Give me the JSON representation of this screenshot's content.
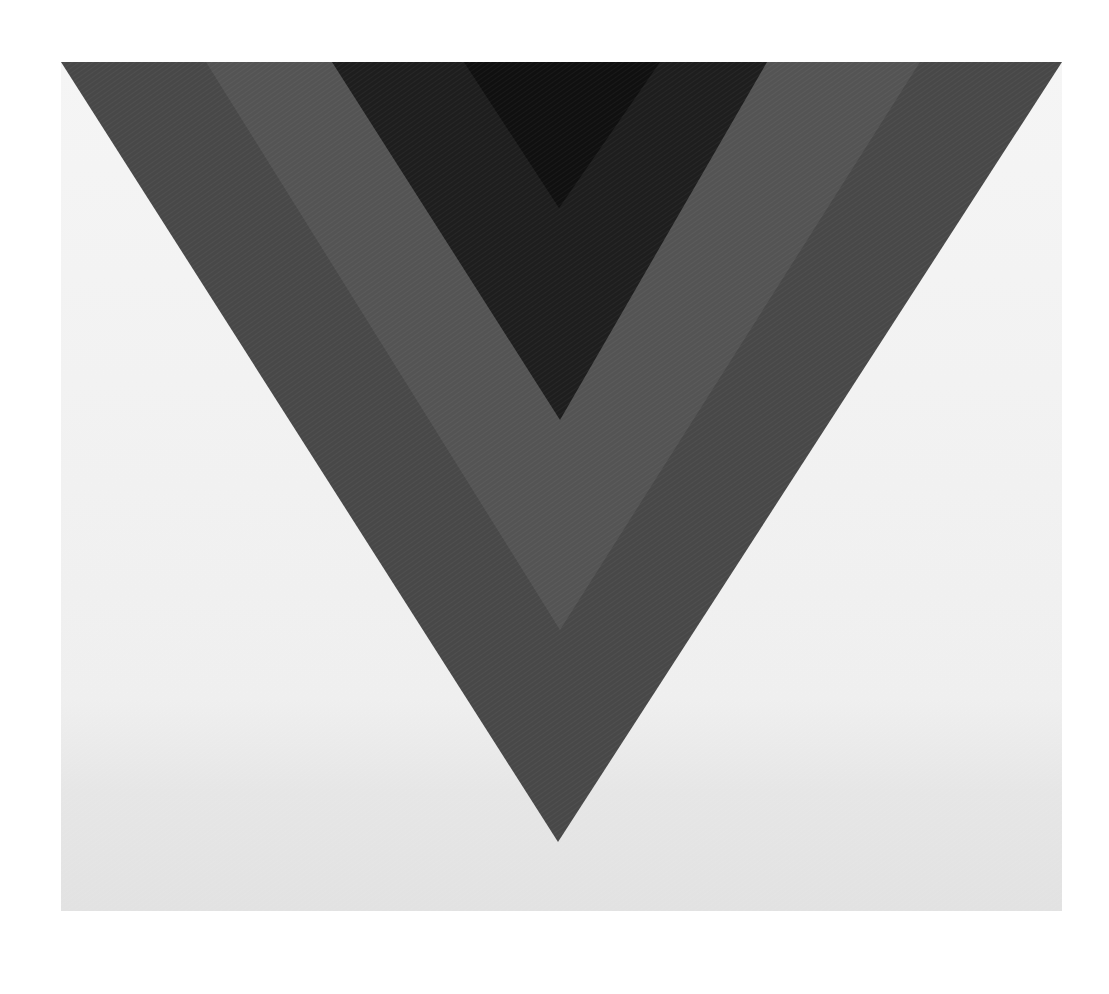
{
  "artwork": {
    "type": "hard-edge abstract painting reproduction",
    "canvas": {
      "x": 61,
      "y": 62,
      "width": 1001,
      "height": 849
    },
    "colors": {
      "page_background": "#ffffff",
      "canvas_ground_top": "#f4f4f4",
      "canvas_ground_bottom": "#e4e4e4",
      "outer_band": "#484848",
      "middle_band_light": "#545454",
      "dark_band": "#1e1e1e",
      "innermost_band": "#101010"
    },
    "bands": [
      {
        "name": "outer-chevron",
        "color_key": "outer_band",
        "points": [
          [
            61,
            62
          ],
          [
            1062,
            62
          ],
          [
            558,
            842
          ]
        ]
      },
      {
        "name": "middle-light-chevron",
        "color_key": "middle_band_light",
        "points": [
          [
            206,
            62
          ],
          [
            920,
            62
          ],
          [
            560,
            630
          ]
        ]
      },
      {
        "name": "dark-chevron",
        "color_key": "dark_band",
        "points": [
          [
            332,
            62
          ],
          [
            767,
            62
          ],
          [
            560,
            420
          ]
        ]
      },
      {
        "name": "innermost-chevron",
        "color_key": "innermost_band",
        "points": [
          [
            464,
            62
          ],
          [
            660,
            62
          ],
          [
            559,
            208
          ]
        ]
      }
    ]
  }
}
